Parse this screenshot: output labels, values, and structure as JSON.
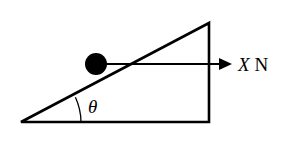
{
  "diagram": {
    "title": "",
    "incline": {
      "angle_label": "θ",
      "vertices": {
        "bottom_left": [
          21,
          122
        ],
        "bottom_right": [
          209,
          122
        ],
        "top": [
          209,
          23
        ]
      }
    },
    "ball": {
      "center": [
        96,
        64
      ],
      "radius": 11
    },
    "force": {
      "variable": "X",
      "unit": "N",
      "direction": "horizontal-right"
    },
    "colors": {
      "stroke": "#000000",
      "background": "#ffffff"
    }
  }
}
